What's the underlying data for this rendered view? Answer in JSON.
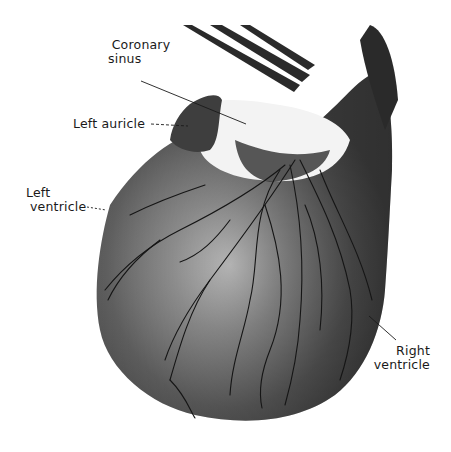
{
  "figure": {
    "colors": {
      "background": "#ffffff",
      "muscle_dark": "#4a4a4a",
      "muscle_mid": "#6e6e6e",
      "highlight": "#d9d9d9",
      "vessel": "#151515",
      "fat": "#f2f2f2"
    }
  },
  "labels": {
    "coronary_sinus_line1": "Coronary",
    "coronary_sinus_line2": "sinus",
    "left_auricle": "Left auricle",
    "left_ventricle_line1": "Left",
    "left_ventricle_line2": "ventricle",
    "right_ventricle_line1": "Right",
    "right_ventricle_line2": "ventricle"
  }
}
